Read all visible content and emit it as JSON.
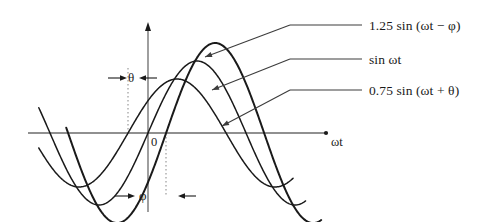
{
  "figure": {
    "background_color": "#ffffff",
    "curve_color": "#1a1a1a",
    "axis_color": "#6b6b6b",
    "leader_color": "#3c3c3c",
    "guide_color": "#9a9a9a"
  },
  "axes": {
    "x_axis_label": "ωt",
    "origin_label": "0",
    "x_axis_y": 133,
    "x_axis_start": 28,
    "x_axis_end": 327,
    "y_axis_x": 148,
    "y_axis_top": 22,
    "y_axis_bottom": 212
  },
  "annotations": {
    "theta": {
      "label": "θ",
      "guide_x": 128,
      "guide_top": 68,
      "guide_bottom": 133,
      "marker_y": 78
    },
    "phi": {
      "label": "φ",
      "guide_x": 166,
      "guide_top": 133,
      "guide_bottom": 196,
      "marker_y": 196
    }
  },
  "legend": [
    {
      "label": "1.25 sin (ωt − φ)",
      "text_x": 369,
      "text_y": 19,
      "rule_x1": 290,
      "rule_x2": 362,
      "rule_y": 25,
      "leader_x": 205,
      "leader_y": 57
    },
    {
      "label": "sin ωt",
      "text_x": 369,
      "text_y": 53,
      "rule_x1": 290,
      "rule_x2": 362,
      "rule_y": 59,
      "leader_x": 212,
      "leader_y": 90
    },
    {
      "label": "0.75 sin (ωt + θ)",
      "text_x": 369,
      "text_y": 84,
      "rule_x1": 290,
      "rule_x2": 362,
      "rule_y": 90,
      "leader_x": 222,
      "leader_y": 126
    }
  ],
  "chart_data": {
    "type": "line",
    "title": "",
    "xlabel": "ωt",
    "ylabel": "",
    "grid": false,
    "legend_position": "right",
    "x_unit": "radians",
    "x_range_rad": [
      -3.5,
      6.1
    ],
    "y_range_amplitude": [
      -1.45,
      1.45
    ],
    "px_per_rad": 31.2,
    "px_per_amplitude": 72,
    "series": [
      {
        "name": "1.25 sin (ωt − φ)",
        "amplitude": 1.25,
        "phase_rad": -0.58,
        "phase_label": "−φ",
        "stroke_width": 2.0,
        "x_start_rad": -2.62,
        "x_end_rad": 5.55
      },
      {
        "name": "sin ωt",
        "amplitude": 1.0,
        "phase_rad": 0.0,
        "phase_label": "0",
        "stroke_width": 1.5,
        "x_start_rad": -3.5,
        "x_end_rad": 5.05
      },
      {
        "name": "0.75 sin (ωt + θ)",
        "amplitude": 0.75,
        "phase_rad": 0.64,
        "phase_label": "+θ",
        "stroke_width": 1.5,
        "x_start_rad": -3.5,
        "x_end_rad": 4.65
      }
    ]
  }
}
